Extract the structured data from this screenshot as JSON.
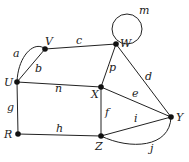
{
  "diagram": {
    "type": "graph",
    "vertices": [
      {
        "id": "U",
        "label": "U",
        "x": 17,
        "y": 82,
        "lx": 4,
        "ly": 86
      },
      {
        "id": "V",
        "label": "V",
        "x": 45,
        "y": 49,
        "lx": 45,
        "ly": 45
      },
      {
        "id": "W",
        "label": "W",
        "x": 116,
        "y": 44,
        "lx": 120,
        "ly": 47
      },
      {
        "id": "X",
        "label": "X",
        "x": 101,
        "y": 87,
        "lx": 91,
        "ly": 97
      },
      {
        "id": "Y",
        "label": "Y",
        "x": 171,
        "y": 117,
        "lx": 176,
        "ly": 121
      },
      {
        "id": "Z",
        "label": "Z",
        "x": 101,
        "y": 136,
        "lx": 95,
        "ly": 150
      },
      {
        "id": "R",
        "label": "R",
        "x": 18,
        "y": 134,
        "lx": 4,
        "ly": 138
      }
    ],
    "edges": [
      {
        "id": "a",
        "label": "a",
        "from": "U",
        "to": "V",
        "curve": true
      },
      {
        "id": "b",
        "label": "b",
        "from": "U",
        "to": "V"
      },
      {
        "id": "c",
        "label": "c",
        "from": "V",
        "to": "W"
      },
      {
        "id": "d",
        "label": "d",
        "from": "W",
        "to": "Y"
      },
      {
        "id": "e",
        "label": "e",
        "from": "X",
        "to": "Y"
      },
      {
        "id": "f",
        "label": "f",
        "from": "X",
        "to": "Z"
      },
      {
        "id": "g",
        "label": "g",
        "from": "U",
        "to": "R"
      },
      {
        "id": "h",
        "label": "h",
        "from": "R",
        "to": "Z"
      },
      {
        "id": "i",
        "label": "i",
        "from": "Z",
        "to": "Y"
      },
      {
        "id": "j",
        "label": "j",
        "from": "Z",
        "to": "Y",
        "curve": true
      },
      {
        "id": "m",
        "label": "m",
        "from": "W",
        "to": "W",
        "loop": true
      },
      {
        "id": "n",
        "label": "n",
        "from": "U",
        "to": "X"
      },
      {
        "id": "p",
        "label": "p",
        "from": "X",
        "to": "W"
      }
    ]
  }
}
